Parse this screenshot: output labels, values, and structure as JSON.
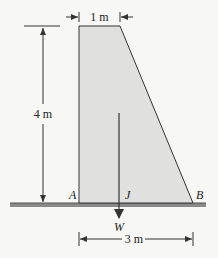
{
  "diagram": {
    "type": "dam cross-section (trapezoid) with weight force",
    "colors": {
      "background": "#f7f7f5",
      "fill": "#e0e0df",
      "stroke": "#333333",
      "ground": "#555555"
    },
    "dimensions": {
      "top_width": "1 m",
      "height": "4 m",
      "base_width": "3 m"
    },
    "points": {
      "a": "A",
      "j": "J",
      "b": "B"
    },
    "force": {
      "label": "W"
    }
  }
}
